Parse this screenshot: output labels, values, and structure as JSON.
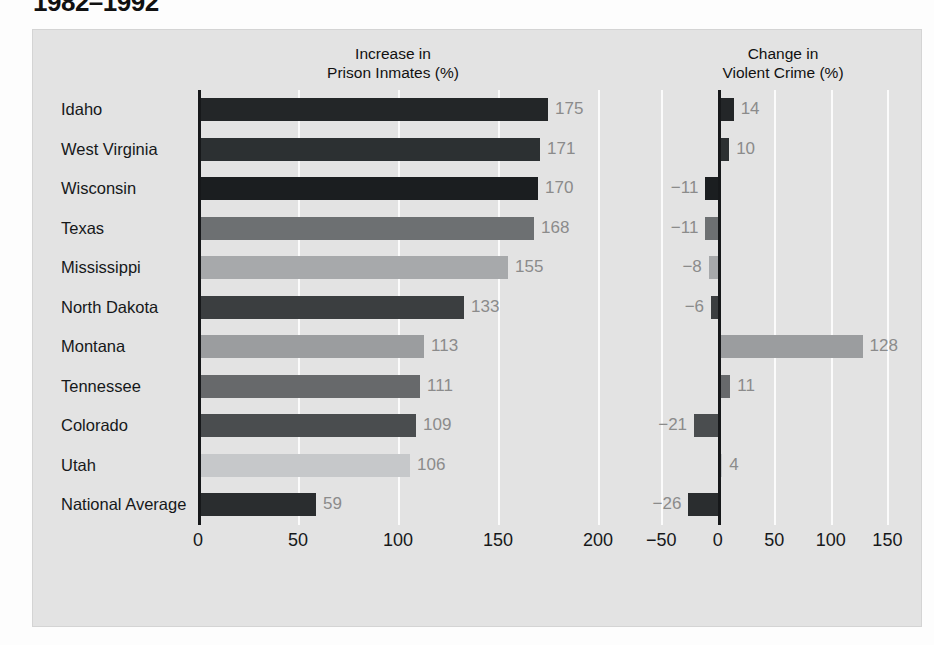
{
  "title": "1982–1992",
  "panels": {
    "left": {
      "header_line1": "Increase in",
      "header_line2": "Prison Inmates (%)"
    },
    "right": {
      "header_line1": "Change in",
      "header_line2": "Violent Crime (%)"
    }
  },
  "chart_data": {
    "type": "bar",
    "title": "1982–1992",
    "orientation": "horizontal",
    "grid": true,
    "legend": "none",
    "categories": [
      "Idaho",
      "West Virginia",
      "Wisconsin",
      "Texas",
      "Mississippi",
      "North Dakota",
      "Montana",
      "Tennessee",
      "Colorado",
      "Utah",
      "National Average"
    ],
    "series": [
      {
        "name": "Increase in Prison Inmates (%)",
        "xlabel": "",
        "ylabel": "",
        "xlim": [
          0,
          215
        ],
        "ticks": [
          0,
          50,
          100,
          150,
          200
        ],
        "values": [
          175,
          171,
          170,
          168,
          155,
          133,
          113,
          111,
          109,
          106,
          59
        ],
        "labels": [
          "175",
          "171",
          "170",
          "168",
          "155",
          "133",
          "113",
          "111",
          "109",
          "106",
          "59"
        ]
      },
      {
        "name": "Change in Violent Crime (%)",
        "xlabel": "",
        "ylabel": "",
        "xlim": [
          -60,
          170
        ],
        "ticks": [
          -50,
          0,
          50,
          100,
          150
        ],
        "values": [
          14,
          10,
          -11,
          -11,
          -8,
          -6,
          128,
          11,
          -21,
          4,
          -26
        ],
        "labels": [
          "14",
          "10",
          "−11",
          "−11",
          "−8",
          "−6",
          "128",
          "11",
          "−21",
          "4",
          "−26"
        ]
      }
    ],
    "bar_colors": [
      "#232628",
      "#2c3032",
      "#1b1e20",
      "#6d7072",
      "#a7a9ab",
      "#3b3e40",
      "#9b9d9f",
      "#67696b",
      "#4a4d4f",
      "#c6c8ca",
      "#2a2d2f"
    ],
    "tick_labels_left": [
      "0",
      "50",
      "100",
      "150",
      "200"
    ],
    "tick_labels_right": [
      "−50",
      "0",
      "50",
      "100",
      "150"
    ]
  },
  "colors": {
    "panel_background": "#e3e3e3",
    "gridline": "#fbfbfb",
    "axis": "#16181a",
    "value_text": "#8b8b8b",
    "label_text": "#16181a"
  }
}
